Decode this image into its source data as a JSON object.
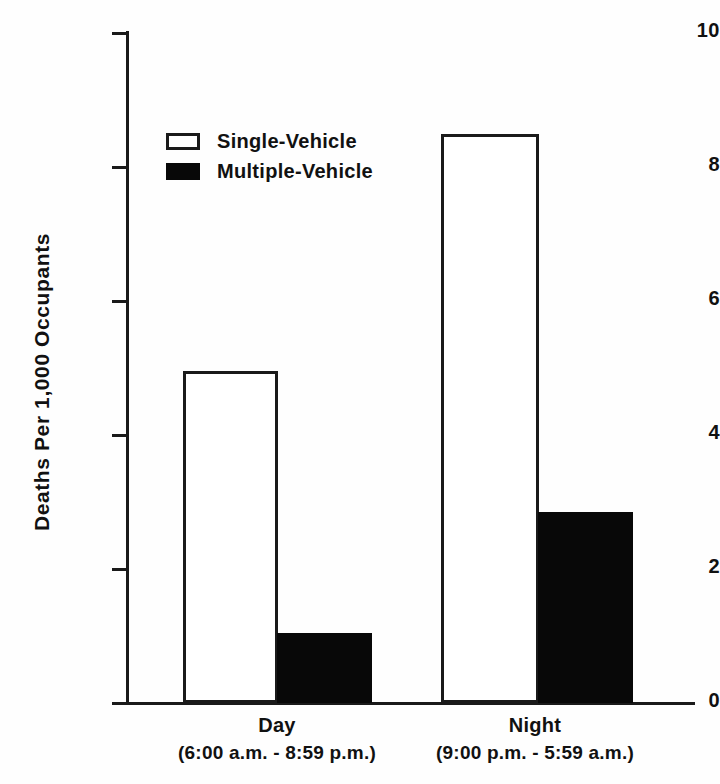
{
  "chart_data": {
    "type": "bar",
    "title": "",
    "xlabel": "",
    "ylabel": "Deaths Per 1,000 Occupants",
    "ylim": [
      0,
      10
    ],
    "yticks": [
      0,
      2,
      4,
      6,
      8,
      10
    ],
    "ytick_labels": [
      "0",
      "2",
      "4",
      "6",
      "8",
      "10"
    ],
    "grid": false,
    "legend_position": "upper-left-inside",
    "categories": [
      "Day",
      "Night"
    ],
    "category_sublabels": [
      "(6:00 a.m. - 8:59 p.m.)",
      "(9:00 p.m. - 5:59 a.m.)"
    ],
    "series": [
      {
        "name": "Single-Vehicle",
        "fill": "#ffffff",
        "edge": "#1a1a1a",
        "values": [
          4.95,
          8.5
        ]
      },
      {
        "name": "Multiple-Vehicle",
        "fill": "#080808",
        "edge": "#080808",
        "values": [
          1.05,
          2.85
        ]
      }
    ]
  },
  "axis": {
    "y_label": "Deaths Per 1,000 Occupants",
    "ticks": [
      {
        "label": "10",
        "value": 10
      },
      {
        "label": "8",
        "value": 8
      },
      {
        "label": "6",
        "value": 6
      },
      {
        "label": "4",
        "value": 4
      },
      {
        "label": "2",
        "value": 2
      },
      {
        "label": "0",
        "value": 0
      }
    ]
  },
  "legend": {
    "items": [
      {
        "label": "Single-Vehicle",
        "style": "outline"
      },
      {
        "label": "Multiple-Vehicle",
        "style": "filled"
      }
    ]
  },
  "xaxis": {
    "groups": [
      {
        "name": "Day",
        "range": "(6:00 a.m. - 8:59 p.m.)"
      },
      {
        "name": "Night",
        "range": "(9:00 p.m. - 5:59 a.m.)"
      }
    ]
  },
  "colors": {
    "ink": "#1a1a1a",
    "fill_dark": "#080808",
    "fill_light": "#ffffff",
    "background": "#fefefe"
  }
}
